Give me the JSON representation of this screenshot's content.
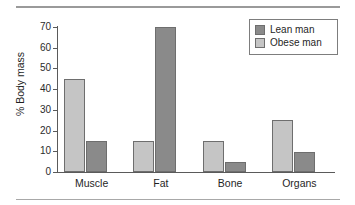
{
  "chart_data": {
    "type": "bar",
    "title": "",
    "subtitle": "",
    "xlabel": "",
    "ylabel": "% Body mass",
    "categories": [
      "Muscle",
      "Fat",
      "Bone",
      "Organs"
    ],
    "series": [
      {
        "name": "Obese man",
        "color": "#c5c5c5",
        "values": [
          45,
          15,
          15,
          25
        ]
      },
      {
        "name": "Lean man",
        "color": "#8a8a8a",
        "values": [
          15,
          70,
          5,
          9.5
        ]
      }
    ],
    "legend_entries": [
      "Lean man",
      "Obese man"
    ],
    "legend_position": "top-right",
    "ylim": [
      0,
      70
    ],
    "ytick_labels": [
      "0",
      "10",
      "20",
      "30",
      "40",
      "50",
      "60",
      "70"
    ],
    "ytick_values": [
      0,
      10,
      20,
      30,
      40,
      50,
      60,
      70
    ],
    "grid": false,
    "bar_order_in_group": [
      "Obese man",
      "Lean man"
    ]
  },
  "decor": {
    "top_rule_color": "#9a9a9a",
    "bottom_rule_color": "#a8a8a8"
  }
}
